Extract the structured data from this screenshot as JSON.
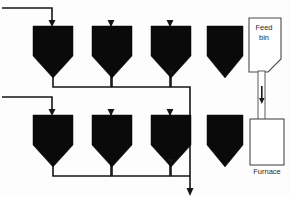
{
  "diagram": {
    "type": "process-flow",
    "canvas": {
      "width": 290,
      "height": 198
    },
    "colors": {
      "hopper_fill": "#0a0a0a",
      "pipe_stroke": "#151515",
      "vessel_stroke": "#4a4a4a",
      "vessel_fill": "#ffffff",
      "background": "#fdfdfd",
      "text": "#2b2b2b"
    },
    "labels": {
      "feed_bin_line1": "Feed",
      "feed_bin_line2": "bin",
      "furnace": "Furnace"
    },
    "hoppers": [
      {
        "id": "hopper-r1-c1",
        "row": 1,
        "col": 1,
        "x": 33,
        "y": 26,
        "w": 40,
        "body_h": 30,
        "cone_h": 22,
        "filled": true,
        "has_inlet_arrow": true,
        "has_outlet_arrow": false
      },
      {
        "id": "hopper-r1-c2",
        "row": 1,
        "col": 2,
        "x": 92,
        "y": 26,
        "w": 40,
        "body_h": 30,
        "cone_h": 22,
        "filled": true,
        "has_inlet_arrow": true,
        "has_outlet_arrow": false
      },
      {
        "id": "hopper-r1-c3",
        "row": 1,
        "col": 3,
        "x": 151,
        "y": 26,
        "w": 40,
        "body_h": 30,
        "cone_h": 22,
        "filled": true,
        "has_inlet_arrow": true,
        "has_outlet_arrow": true
      },
      {
        "id": "hopper-r1-c4",
        "row": 1,
        "col": 4,
        "x": 207,
        "y": 26,
        "w": 36,
        "body_h": 30,
        "cone_h": 22,
        "filled": true,
        "has_inlet_arrow": false,
        "has_outlet_arrow": false
      },
      {
        "id": "hopper-r2-c1",
        "row": 2,
        "col": 1,
        "x": 33,
        "y": 115,
        "w": 40,
        "body_h": 30,
        "cone_h": 22,
        "filled": true,
        "has_inlet_arrow": true,
        "has_outlet_arrow": false
      },
      {
        "id": "hopper-r2-c2",
        "row": 2,
        "col": 2,
        "x": 92,
        "y": 115,
        "w": 40,
        "body_h": 30,
        "cone_h": 22,
        "filled": true,
        "has_inlet_arrow": true,
        "has_outlet_arrow": false
      },
      {
        "id": "hopper-r2-c3",
        "row": 2,
        "col": 3,
        "x": 151,
        "y": 115,
        "w": 40,
        "body_h": 30,
        "cone_h": 22,
        "filled": true,
        "has_inlet_arrow": true,
        "has_outlet_arrow": true
      },
      {
        "id": "hopper-r2-c4",
        "row": 2,
        "col": 4,
        "x": 207,
        "y": 115,
        "w": 36,
        "body_h": 30,
        "cone_h": 22,
        "filled": true,
        "has_inlet_arrow": false,
        "has_outlet_arrow": false
      }
    ],
    "pipes": [
      {
        "id": "inlet-row1",
        "path": "M 2 8 L 52 8 L 52 22"
      },
      {
        "id": "outlet-r1c1-to-r1c2",
        "path": "M 53 70 L 53 87 L 111 87 L 111 22"
      },
      {
        "id": "outlet-r1c2-to-r1c3",
        "path": "M 112 70 L 112 87 L 170 87 L 170 22"
      },
      {
        "id": "outlet-r1c3-to-lower",
        "path": "M 171 70 L 171 87 L 190 87 L 190 176"
      },
      {
        "id": "inlet-row2",
        "path": "M 2 97 L 52 97 L 52 111"
      },
      {
        "id": "outlet-r2c1-to-r2c2",
        "path": "M 53 159 L 53 176 L 111 176 L 111 111"
      },
      {
        "id": "outlet-r2c2-to-r2c3",
        "path": "M 112 159 L 112 176 L 170 176 L 170 111"
      },
      {
        "id": "outlet-r2c3-to-exit",
        "path": "M 171 159 L 171 176 L 190 176"
      }
    ],
    "arrows": [
      {
        "id": "arrow-inlet-r1c1",
        "x": 52,
        "y": 25,
        "dir": "down"
      },
      {
        "id": "arrow-inlet-r1c2",
        "x": 111,
        "y": 25,
        "dir": "down"
      },
      {
        "id": "arrow-inlet-r1c3",
        "x": 170,
        "y": 25,
        "dir": "down"
      },
      {
        "id": "arrow-outlet-r1c3",
        "x": 171,
        "y": 73,
        "dir": "down"
      },
      {
        "id": "arrow-inlet-r2c1",
        "x": 52,
        "y": 114,
        "dir": "down"
      },
      {
        "id": "arrow-inlet-r2c2",
        "x": 111,
        "y": 114,
        "dir": "down"
      },
      {
        "id": "arrow-inlet-r2c3",
        "x": 170,
        "y": 114,
        "dir": "down"
      },
      {
        "id": "arrow-outlet-r2c3",
        "x": 171,
        "y": 162,
        "dir": "down"
      },
      {
        "id": "arrow-exit-bottom",
        "x": 190,
        "y": 194,
        "dir": "down"
      }
    ],
    "feed_bin": {
      "x": 249,
      "y": 18,
      "w": 32,
      "h": 54,
      "chamfer": 13,
      "chamfer_corner": "bottom-right"
    },
    "duct": {
      "x": 258,
      "y": 72,
      "w": 7,
      "h": 47,
      "arrow": {
        "x": 261.5,
        "y": 96,
        "dir": "down"
      }
    },
    "furnace": {
      "x": 250,
      "y": 119,
      "w": 34,
      "h": 46
    }
  }
}
